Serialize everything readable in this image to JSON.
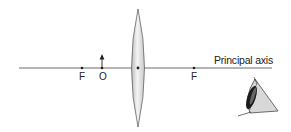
{
  "diagram": {
    "type": "convex-lens-ray-setup",
    "axis_label": "Principal axis",
    "points": {
      "focus_left": "F",
      "object": "O",
      "focus_right": "F"
    },
    "elements": [
      "principal-axis",
      "convex-lens",
      "object-arrow",
      "observer-eye"
    ]
  }
}
